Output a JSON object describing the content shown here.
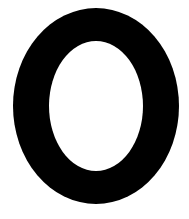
{
  "glyph": {
    "character": "O",
    "color": "#000000",
    "background": "#ffffff"
  }
}
